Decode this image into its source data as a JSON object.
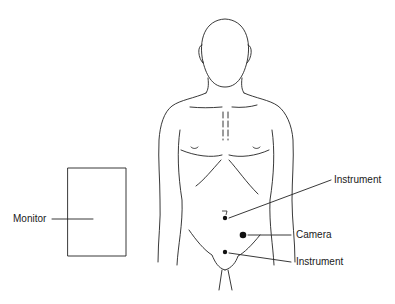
{
  "diagram": {
    "labels": {
      "monitor": "Monitor",
      "instrument_upper": "Instrument",
      "camera": "Camera",
      "instrument_lower": "Instrument"
    },
    "colors": {
      "line": "#222222",
      "background": "#ffffff"
    }
  }
}
